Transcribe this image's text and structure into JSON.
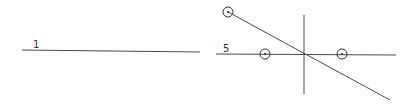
{
  "figures": [
    {
      "id": "figure-1",
      "label": "1",
      "label_pos": [
        33,
        48
      ],
      "lines": [
        {
          "name": "horizontal-line",
          "x1": 22,
          "y1": 50,
          "x2": 200,
          "y2": 52
        }
      ],
      "points": []
    },
    {
      "id": "figure-5",
      "label": "5",
      "label_pos": [
        223,
        52
      ],
      "lines": [
        {
          "name": "horizontal-line",
          "x1": 216,
          "y1": 54,
          "x2": 396,
          "y2": 55
        },
        {
          "name": "vertical-line",
          "x1": 304,
          "y1": 15,
          "x2": 304,
          "y2": 94
        },
        {
          "name": "diagonal-line",
          "x1": 228,
          "y1": 12,
          "x2": 390,
          "y2": 100
        }
      ],
      "points": [
        {
          "name": "circled-point-top-left",
          "cx": 228,
          "cy": 12,
          "r": 5
        },
        {
          "name": "circled-point-left",
          "cx": 265,
          "cy": 54,
          "r": 5
        },
        {
          "name": "circled-point-right",
          "cx": 342,
          "cy": 54,
          "r": 5
        }
      ]
    }
  ],
  "colors": {
    "line": "#4a4a4a",
    "text": "#333333",
    "background": "#ffffff"
  }
}
